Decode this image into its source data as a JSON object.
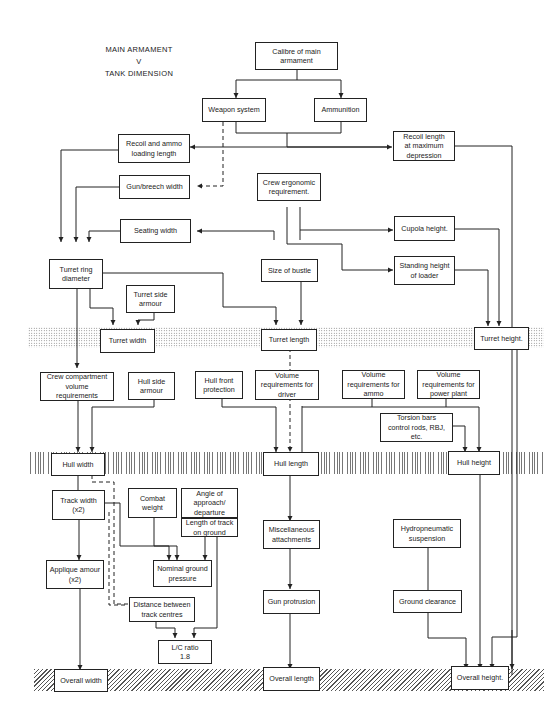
{
  "title": {
    "line1": "MAIN ARMAMENT",
    "line2": "V",
    "line3": "TANK DIMENSION"
  },
  "bands": [
    {
      "name": "turret-level-band",
      "pattern": "dots",
      "y": 327
    },
    {
      "name": "hull-level-band",
      "pattern": "vertical",
      "y": 452
    },
    {
      "name": "overall-level-band",
      "pattern": "diagonal",
      "y": 669
    }
  ],
  "nodes": {
    "calibre": "Calibre of main\narmament",
    "weapon_system": "Weapon system",
    "ammunition": "Ammunition",
    "recoil_ammo": "Recoil and ammo\nloading length",
    "recoil_depression": "Recoil length\nat maximum\ndepression",
    "gun_breech": "Gun/breech width",
    "crew_ergonomic": "Crew ergonomic\nrequirement.",
    "seating_width": "Seating width",
    "cupola_height": "Cupola height.",
    "turret_ring": "Turret ring\ndiameter",
    "size_bustle": "Size of bustle",
    "standing_height": "Standing height\nof loader",
    "turret_side_armour": "Turret side\narmour",
    "turret_width": "Turret width",
    "turret_length": "Turret length",
    "turret_height": "Turret height.",
    "crew_compartment": "Crew compartment\nvolume\nrequirements",
    "hull_side_armour": "Hull side\narmour",
    "hull_front": "Hull front\nprotection",
    "vol_driver": "Volume\nrequirements for\ndriver",
    "vol_ammo": "Volume\nrequirements for\nammo",
    "vol_power": "Volume\nrequirements for\npower plant",
    "torsion_bars": "Torsion bars\ncontrol rods, RBJ,\netc.",
    "hull_width": "Hull width",
    "hull_length": "Hull length",
    "hull_height": "Hull height",
    "track_width": "Track width\n(x2)",
    "combat_weight": "Combat\nweight",
    "angle_approach": "Angle of\napproach/\ndeparture",
    "length_track": "Length of track\non ground",
    "misc_attachments": "Miscellaneous\nattachments",
    "hydropneumatic": "Hydropneumatic\nsuspension",
    "applique_armour": "Applique amour\n(x2)",
    "nominal_ground": "Nominal ground\npressure",
    "distance_track": "Distance between\ntrack centres",
    "gun_protrusion": "Gun protrusion",
    "ground_clearance": "Ground clearance",
    "lc_ratio": "L/C ratio\n1.8",
    "overall_width": "Overall width",
    "overall_length": "Overall length",
    "overall_height": "Overall height."
  },
  "colors": {
    "line": "#222222",
    "background": "#ffffff"
  }
}
